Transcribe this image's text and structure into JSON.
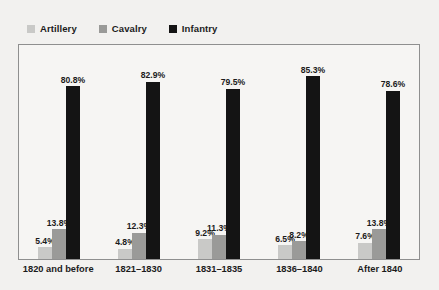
{
  "chart_data": {
    "type": "bar",
    "title": "",
    "subtitle": "",
    "xlabel": "",
    "ylabel": "",
    "ylim": [
      0,
      100
    ],
    "grid": false,
    "legend_position": "top-left",
    "value_suffix": "%",
    "categories": [
      "1820 and before",
      "1821–1830",
      "1831–1835",
      "1836–1840",
      "After 1840"
    ],
    "series": [
      {
        "name": "Artillery",
        "color": "#c9c9c7",
        "values": [
          5.4,
          4.8,
          9.2,
          6.5,
          7.6
        ],
        "labels": [
          "5.4%",
          "4.8%",
          "9.2%",
          "6.5%",
          "7.6%"
        ]
      },
      {
        "name": "Cavalry",
        "color": "#9a9a98",
        "values": [
          13.8,
          12.3,
          11.3,
          8.2,
          13.8
        ],
        "labels": [
          "13.8%",
          "12.3%",
          "11.3%",
          "8.2%",
          "13.8%"
        ]
      },
      {
        "name": "Infantry",
        "color": "#141414",
        "values": [
          80.8,
          82.9,
          79.5,
          85.3,
          78.6
        ],
        "labels": [
          "80.8%",
          "82.9%",
          "79.5%",
          "85.3%",
          "78.6%"
        ]
      }
    ]
  },
  "legend": {
    "items": [
      {
        "label": "Artillery",
        "color": "#c9c9c7"
      },
      {
        "label": "Cavalry",
        "color": "#9a9a98"
      },
      {
        "label": "Infantry",
        "color": "#141414"
      }
    ]
  },
  "colors": {
    "background": "#f2f1ef",
    "plot_background": "#f6f5f3",
    "frame": "#8f8f8f",
    "text": "#1b1b1b"
  }
}
